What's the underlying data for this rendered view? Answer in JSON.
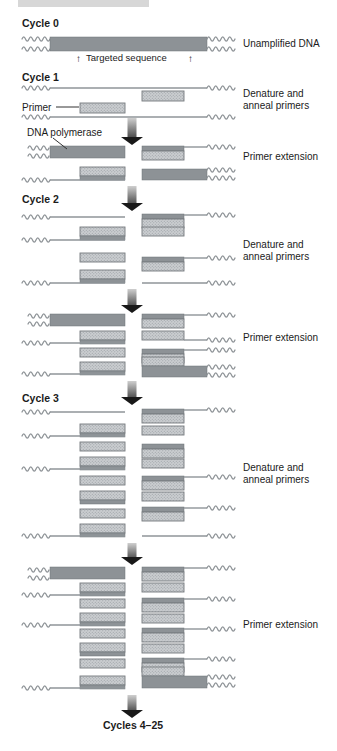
{
  "figure_title": "PCR amplification cycles diagram",
  "palette": {
    "background": "#ffffff",
    "dark_bar": "#8d9296",
    "dark_bar_edge": "#6e7377",
    "light_bar_fill": "#cacdd0",
    "light_bar_dot": "#989da1",
    "light_bar_edge": "#74797d",
    "strand": "#8f9498",
    "text": "#1b1b1b",
    "arrow_dark": "#191919",
    "arrow_mid": "#6b6b6b",
    "arrow_light": "#cfcfcf",
    "artifact": "#d7d7d7"
  },
  "labels": [
    {
      "name": "cycle0-label",
      "text": "Cycle 0",
      "x": 22,
      "y": 27,
      "bold": true,
      "size": 10.5
    },
    {
      "name": "unamplified-dna-label",
      "text": "Unamplified DNA",
      "x": 243,
      "y": 47,
      "size": 10
    },
    {
      "name": "targeted-seq-arrow-left",
      "text": "↑",
      "x": 76,
      "y": 62,
      "size": 10
    },
    {
      "name": "targeted-sequence-label",
      "text": "Targeted sequence",
      "x": 86,
      "y": 61,
      "size": 9.5
    },
    {
      "name": "targeted-seq-arrow-right",
      "text": "↑",
      "x": 188,
      "y": 62,
      "size": 10
    },
    {
      "name": "cycle1-label",
      "text": "Cycle 1",
      "x": 22,
      "y": 81,
      "bold": true,
      "size": 10.5
    },
    {
      "name": "denature-anneal-label-1a",
      "text": "Denature and",
      "x": 243,
      "y": 97,
      "size": 10
    },
    {
      "name": "denature-anneal-label-1b",
      "text": "anneal primers",
      "x": 243,
      "y": 109,
      "size": 10
    },
    {
      "name": "primer-label",
      "text": "Primer",
      "x": 22,
      "y": 111,
      "size": 10
    },
    {
      "name": "dna-polymerase-label",
      "text": "DNA polymerase",
      "x": 27,
      "y": 136,
      "size": 10
    },
    {
      "name": "primer-extension-label-1",
      "text": "Primer extension",
      "x": 243,
      "y": 160,
      "size": 10
    },
    {
      "name": "cycle2-label",
      "text": "Cycle 2",
      "x": 22,
      "y": 203,
      "bold": true,
      "size": 10.5
    },
    {
      "name": "denature-anneal-label-2a",
      "text": "Denature and",
      "x": 243,
      "y": 248,
      "size": 10
    },
    {
      "name": "denature-anneal-label-2b",
      "text": "anneal primers",
      "x": 243,
      "y": 260,
      "size": 10
    },
    {
      "name": "primer-extension-label-2",
      "text": "Primer extension",
      "x": 243,
      "y": 341,
      "size": 10
    },
    {
      "name": "cycle3-label",
      "text": "Cycle 3",
      "x": 22,
      "y": 402,
      "bold": true,
      "size": 10.5
    },
    {
      "name": "denature-anneal-label-3a",
      "text": "Denature and",
      "x": 243,
      "y": 471,
      "size": 10
    },
    {
      "name": "denature-anneal-label-3b",
      "text": "anneal primers",
      "x": 243,
      "y": 483,
      "size": 10
    },
    {
      "name": "primer-extension-label-3",
      "text": "Primer extension",
      "x": 243,
      "y": 628,
      "size": 10
    },
    {
      "name": "cycles-4-25-label",
      "text": "Cycles 4–25",
      "x": 133,
      "y": 729,
      "bold": true,
      "size": 10.5,
      "anchor": "middle"
    }
  ],
  "pointers": [
    {
      "name": "primer-pointer",
      "points": [
        [
          56,
          107
        ],
        [
          79,
          107
        ]
      ]
    },
    {
      "name": "dna-polymerase-pointer",
      "points": [
        [
          53,
          138
        ],
        [
          67,
          149
        ]
      ]
    }
  ],
  "arrows": [
    {
      "name": "cycle-arrow-1",
      "x": 132,
      "y1": 118,
      "y2": 145
    },
    {
      "name": "cycle-arrow-2",
      "x": 132,
      "y1": 186,
      "y2": 211
    },
    {
      "name": "cycle-arrow-3",
      "x": 132,
      "y1": 289,
      "y2": 313
    },
    {
      "name": "cycle-arrow-4",
      "x": 132,
      "y1": 381,
      "y2": 405
    },
    {
      "name": "cycle-arrow-5",
      "x": 132,
      "y1": 543,
      "y2": 565
    },
    {
      "name": "cycle-arrow-6",
      "x": 132,
      "y1": 695,
      "y2": 718
    }
  ],
  "artifact_bar": {
    "x": 18,
    "y": 0,
    "w": 131,
    "h": 7
  },
  "strand_kinds": {
    "w": "dna-flank-wavy",
    "l": "dna-strand-line",
    "d": "target-dna-bar",
    "L": "new-dna-bar"
  },
  "strands": [
    [
      "w",
      22,
      39,
      28
    ],
    [
      "w",
      22,
      49,
      28
    ],
    [
      "d",
      50,
      37,
      157,
      14
    ],
    [
      "w",
      207,
      39,
      28
    ],
    [
      "w",
      207,
      49,
      28
    ],
    [
      "w",
      22,
      88,
      28
    ],
    [
      "l",
      50,
      88,
      157
    ],
    [
      "w",
      207,
      88,
      28
    ],
    [
      "L",
      142,
      91,
      42,
      10
    ],
    [
      "L",
      80,
      103,
      45,
      10
    ],
    [
      "w",
      22,
      117,
      28
    ],
    [
      "l",
      50,
      117,
      157
    ],
    [
      "w",
      207,
      117,
      28
    ],
    [
      "w",
      28,
      148,
      22
    ],
    [
      "w",
      28,
      156,
      22
    ],
    [
      "d",
      50,
      146,
      75,
      12
    ],
    [
      "d",
      142,
      146,
      42,
      5
    ],
    [
      "L",
      142,
      151,
      42,
      9
    ],
    [
      "l",
      184,
      147,
      23
    ],
    [
      "w",
      207,
      147,
      28
    ],
    [
      "L",
      80,
      167,
      45,
      9
    ],
    [
      "d",
      80,
      176,
      45,
      4
    ],
    [
      "w",
      22,
      180,
      28
    ],
    [
      "l",
      50,
      180,
      75
    ],
    [
      "d",
      142,
      169,
      65,
      11
    ],
    [
      "w",
      207,
      170,
      28
    ],
    [
      "w",
      207,
      178,
      28
    ],
    [
      "w",
      22,
      217,
      28
    ],
    [
      "l",
      50,
      217,
      75
    ],
    [
      "d",
      142,
      214,
      42,
      5
    ],
    [
      "L",
      142,
      219,
      42,
      9
    ],
    [
      "l",
      184,
      215,
      23
    ],
    [
      "w",
      207,
      215,
      28
    ],
    [
      "L",
      80,
      227,
      45,
      9
    ],
    [
      "d",
      80,
      236,
      45,
      4
    ],
    [
      "w",
      22,
      240,
      28
    ],
    [
      "l",
      50,
      240,
      75
    ],
    [
      "L",
      142,
      227,
      42,
      9
    ],
    [
      "L",
      80,
      253,
      45,
      9
    ],
    [
      "d",
      142,
      257,
      42,
      5
    ],
    [
      "L",
      142,
      262,
      42,
      9
    ],
    [
      "l",
      184,
      258,
      23
    ],
    [
      "w",
      207,
      258,
      28
    ],
    [
      "L",
      80,
      270,
      45,
      9
    ],
    [
      "d",
      80,
      279,
      45,
      4
    ],
    [
      "w",
      22,
      283,
      28
    ],
    [
      "l",
      50,
      283,
      75
    ],
    [
      "l",
      142,
      283,
      65
    ],
    [
      "w",
      207,
      283,
      28
    ],
    [
      "w",
      28,
      316,
      22
    ],
    [
      "w",
      28,
      324,
      22
    ],
    [
      "d",
      50,
      314,
      75,
      12
    ],
    [
      "d",
      142,
      314,
      42,
      5
    ],
    [
      "L",
      142,
      319,
      42,
      9
    ],
    [
      "l",
      184,
      315,
      23
    ],
    [
      "w",
      207,
      315,
      28
    ],
    [
      "L",
      80,
      331,
      45,
      9
    ],
    [
      "d",
      80,
      340,
      45,
      4
    ],
    [
      "w",
      22,
      343,
      28
    ],
    [
      "l",
      50,
      343,
      75
    ],
    [
      "L",
      142,
      331,
      42,
      9
    ],
    [
      "l",
      184,
      340,
      23
    ],
    [
      "w",
      207,
      340,
      28
    ],
    [
      "L",
      80,
      348,
      45,
      9
    ],
    [
      "d",
      142,
      349,
      42,
      5
    ],
    [
      "L",
      142,
      354,
      42,
      9
    ],
    [
      "l",
      184,
      350,
      23
    ],
    [
      "w",
      207,
      350,
      28
    ],
    [
      "L",
      80,
      362,
      45,
      9
    ],
    [
      "d",
      80,
      371,
      45,
      4
    ],
    [
      "w",
      22,
      374,
      28
    ],
    [
      "l",
      50,
      374,
      75
    ],
    [
      "L",
      142,
      357,
      42,
      9
    ],
    [
      "d",
      142,
      366,
      65,
      11
    ],
    [
      "w",
      207,
      367,
      28
    ],
    [
      "w",
      207,
      375,
      28
    ],
    [
      "w",
      22,
      412,
      28
    ],
    [
      "l",
      50,
      412,
      75
    ],
    [
      "d",
      142,
      409,
      42,
      5
    ],
    [
      "L",
      142,
      414,
      42,
      9
    ],
    [
      "l",
      184,
      410,
      23
    ],
    [
      "w",
      207,
      410,
      28
    ],
    [
      "L",
      80,
      424,
      45,
      9
    ],
    [
      "d",
      80,
      433,
      45,
      4
    ],
    [
      "w",
      22,
      436,
      28
    ],
    [
      "l",
      50,
      436,
      75
    ],
    [
      "L",
      142,
      426,
      42,
      9
    ],
    [
      "L",
      80,
      442,
      45,
      9
    ],
    [
      "d",
      142,
      444,
      42,
      5
    ],
    [
      "L",
      142,
      449,
      42,
      9
    ],
    [
      "L",
      80,
      457,
      45,
      9
    ],
    [
      "d",
      80,
      466,
      45,
      4
    ],
    [
      "w",
      22,
      469,
      28
    ],
    [
      "l",
      50,
      469,
      75
    ],
    [
      "L",
      142,
      459,
      42,
      9
    ],
    [
      "L",
      80,
      476,
      45,
      9
    ],
    [
      "d",
      142,
      476,
      42,
      5
    ],
    [
      "L",
      142,
      481,
      42,
      9
    ],
    [
      "l",
      184,
      477,
      23
    ],
    [
      "w",
      207,
      477,
      28
    ],
    [
      "L",
      80,
      491,
      45,
      9
    ],
    [
      "d",
      80,
      500,
      45,
      4
    ],
    [
      "L",
      142,
      492,
      42,
      9
    ],
    [
      "L",
      80,
      509,
      45,
      9
    ],
    [
      "d",
      142,
      507,
      42,
      5
    ],
    [
      "L",
      142,
      512,
      42,
      9
    ],
    [
      "l",
      184,
      508,
      23
    ],
    [
      "w",
      207,
      508,
      28
    ],
    [
      "L",
      80,
      524,
      45,
      9
    ],
    [
      "d",
      80,
      533,
      45,
      4
    ],
    [
      "w",
      22,
      536,
      28
    ],
    [
      "l",
      50,
      536,
      75
    ],
    [
      "l",
      142,
      536,
      65
    ],
    [
      "w",
      207,
      536,
      28
    ],
    [
      "w",
      28,
      570,
      22
    ],
    [
      "w",
      28,
      578,
      22
    ],
    [
      "d",
      50,
      567,
      75,
      12
    ],
    [
      "d",
      142,
      567,
      42,
      5
    ],
    [
      "L",
      142,
      572,
      42,
      9
    ],
    [
      "l",
      184,
      568,
      23
    ],
    [
      "w",
      207,
      568,
      28
    ],
    [
      "L",
      80,
      583,
      45,
      9
    ],
    [
      "d",
      80,
      592,
      45,
      4
    ],
    [
      "w",
      22,
      595,
      28
    ],
    [
      "l",
      50,
      595,
      75
    ],
    [
      "L",
      142,
      583,
      42,
      9
    ],
    [
      "L",
      80,
      599,
      45,
      9
    ],
    [
      "d",
      142,
      598,
      42,
      5
    ],
    [
      "L",
      142,
      603,
      42,
      9
    ],
    [
      "l",
      184,
      599,
      23
    ],
    [
      "w",
      207,
      599,
      28
    ],
    [
      "L",
      80,
      613,
      45,
      9
    ],
    [
      "d",
      80,
      622,
      45,
      4
    ],
    [
      "w",
      22,
      625,
      28
    ],
    [
      "l",
      50,
      625,
      75
    ],
    [
      "L",
      142,
      614,
      42,
      9
    ],
    [
      "L",
      80,
      629,
      45,
      9
    ],
    [
      "d",
      142,
      628,
      42,
      5
    ],
    [
      "L",
      142,
      633,
      42,
      9
    ],
    [
      "l",
      184,
      629,
      23
    ],
    [
      "w",
      207,
      629,
      28
    ],
    [
      "L",
      80,
      643,
      45,
      9
    ],
    [
      "d",
      80,
      652,
      45,
      4
    ],
    [
      "L",
      142,
      644,
      42,
      9
    ],
    [
      "L",
      80,
      659,
      45,
      9
    ],
    [
      "d",
      142,
      658,
      42,
      5
    ],
    [
      "L",
      142,
      663,
      42,
      9
    ],
    [
      "l",
      184,
      659,
      23
    ],
    [
      "w",
      207,
      659,
      28
    ],
    [
      "L",
      80,
      676,
      45,
      9
    ],
    [
      "d",
      80,
      685,
      45,
      4
    ],
    [
      "w",
      22,
      688,
      28
    ],
    [
      "l",
      50,
      688,
      75
    ],
    [
      "L",
      142,
      667,
      42,
      9
    ],
    [
      "d",
      142,
      676,
      65,
      12
    ],
    [
      "w",
      207,
      677,
      28
    ],
    [
      "w",
      207,
      685,
      28
    ]
  ]
}
